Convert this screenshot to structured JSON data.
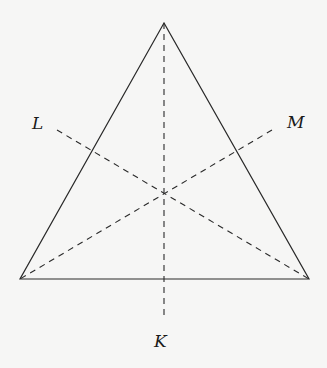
{
  "diagram": {
    "type": "equilateral-triangle-with-symmetry-axes",
    "background_color": "#f6f6f5",
    "stroke_color": "#2a2a2a",
    "vertices": {
      "apex": [
        164,
        23
      ],
      "bottom_left": [
        20,
        279
      ],
      "bottom_right": [
        309,
        279
      ]
    },
    "centroid": [
      164,
      192
    ],
    "axes": [
      {
        "label": "K",
        "from": [
          164,
          23
        ],
        "to": [
          164,
          320
        ]
      },
      {
        "label": "L",
        "from": [
          57,
          130
        ],
        "to": [
          309,
          279
        ]
      },
      {
        "label": "M",
        "from": [
          272,
          130
        ],
        "to": [
          20,
          279
        ]
      }
    ],
    "labels": {
      "K": "K",
      "L": "L",
      "M": "M"
    }
  }
}
